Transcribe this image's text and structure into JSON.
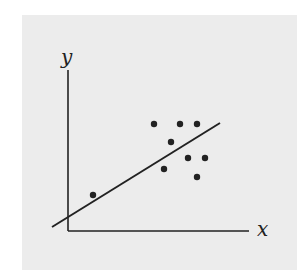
{
  "chart_data": {
    "type": "scatter",
    "title": "",
    "xlabel": "x",
    "ylabel": "y",
    "grid": false,
    "legend": null,
    "points_px": [
      {
        "x": 93,
        "y": 195
      },
      {
        "x": 154,
        "y": 124
      },
      {
        "x": 180,
        "y": 124
      },
      {
        "x": 197,
        "y": 124
      },
      {
        "x": 171,
        "y": 142
      },
      {
        "x": 188,
        "y": 158
      },
      {
        "x": 205,
        "y": 158
      },
      {
        "x": 164,
        "y": 169
      },
      {
        "x": 197,
        "y": 177
      }
    ],
    "points": [
      {
        "x": 0.14,
        "y": 0.23
      },
      {
        "x": 0.47,
        "y": 0.66
      },
      {
        "x": 0.62,
        "y": 0.66
      },
      {
        "x": 0.71,
        "y": 0.66
      },
      {
        "x": 0.57,
        "y": 0.55
      },
      {
        "x": 0.66,
        "y": 0.45
      },
      {
        "x": 0.75,
        "y": 0.45
      },
      {
        "x": 0.53,
        "y": 0.38
      },
      {
        "x": 0.71,
        "y": 0.33
      }
    ],
    "trend_line": {
      "type": "linear fit",
      "from_px": {
        "x": 52,
        "y": 227
      },
      "to_px": {
        "x": 220,
        "y": 123
      }
    },
    "colors": {
      "background": "#ececec",
      "ink": "#222222"
    }
  },
  "labels": {
    "x_axis": "x",
    "y_axis": "y"
  }
}
